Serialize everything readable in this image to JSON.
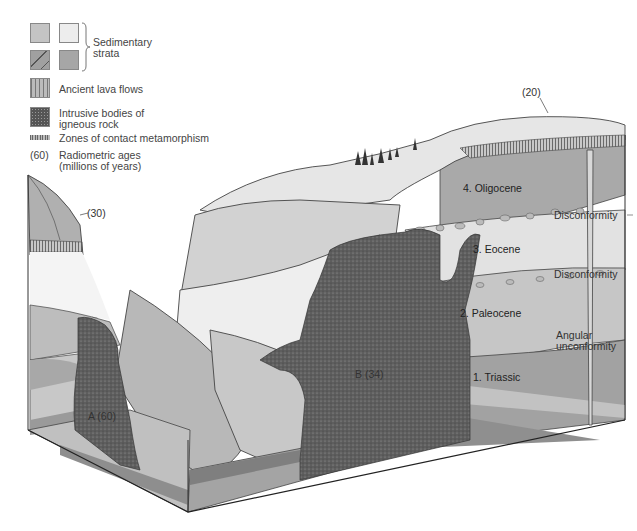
{
  "legend": {
    "sedimentary_label_line1": "Sedimentary",
    "sedimentary_label_line2": "strata",
    "lava_label": "Ancient lava flows",
    "intrusive_label_line1": "Intrusive bodies of",
    "intrusive_label_line2": "igneous rock",
    "metamorphism_label": "Zones of contact metamorphism",
    "age_example": "(60)",
    "age_label_line1": "Radiometric ages",
    "age_label_line2": "(millions of years)",
    "colors": {
      "strata_light_gray": "#c4c4c4",
      "strata_very_light": "#eeeeee",
      "strata_dark_banded": "#9a9a9a",
      "strata_medium": "#a8a8a8",
      "intrusive": "#5a5a5a",
      "lava": "#8c8c8c"
    }
  },
  "diagram": {
    "units": [
      {
        "id": "4",
        "label": "4. Oligocene"
      },
      {
        "id": "3",
        "label": "3. Eocene"
      },
      {
        "id": "2",
        "label": "2. Paleocene"
      },
      {
        "id": "1",
        "label": "1. Triassic"
      }
    ],
    "contacts": [
      {
        "label": "Disconformity"
      },
      {
        "label": "Disconformity"
      },
      {
        "label_line1": "Angular",
        "label_line2": "unconformity"
      }
    ],
    "ages": {
      "lava_top_right": "(20)",
      "lava_left": "(30)",
      "intrusion_a": "A (60)",
      "intrusion_b": "B (34)"
    }
  }
}
